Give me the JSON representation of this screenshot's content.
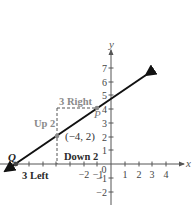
{
  "diagram": {
    "axes": {
      "x_label": "x",
      "y_label": "y",
      "x_ticks": [
        {
          "value": -7,
          "label": ""
        },
        {
          "value": -6,
          "label": ""
        },
        {
          "value": -5,
          "label": ""
        },
        {
          "value": -4,
          "label": ""
        },
        {
          "value": -3,
          "label": ""
        },
        {
          "value": -2,
          "label": "−2"
        },
        {
          "value": -1,
          "label": "−1"
        },
        {
          "value": 1,
          "label": "1"
        },
        {
          "value": 2,
          "label": "2"
        },
        {
          "value": 3,
          "label": "3"
        },
        {
          "value": 4,
          "label": "4"
        }
      ],
      "y_ticks": [
        {
          "value": 7,
          "label": "7"
        },
        {
          "value": 6,
          "label": "6"
        },
        {
          "value": 5,
          "label": "5"
        },
        {
          "value": 4,
          "label": "4"
        },
        {
          "value": 3,
          "label": "3"
        },
        {
          "value": 2,
          "label": "2"
        },
        {
          "value": 1,
          "label": "1"
        },
        {
          "value": -1,
          "label": "−1"
        },
        {
          "value": -2,
          "label": "−2"
        }
      ],
      "origin_label": "0"
    },
    "line": {
      "slope": "2/3",
      "through": [
        -4,
        2
      ],
      "color": "#111111"
    },
    "points": {
      "given": {
        "label": "(−4, 2)",
        "x": -4,
        "y": 2
      },
      "P": {
        "label": "P",
        "x": -1,
        "y": 4
      },
      "Q": {
        "label": "Q",
        "x": -7,
        "y": 0
      }
    },
    "annotations": {
      "right": "3 Right",
      "up": "Up 2",
      "down": "Down 2",
      "left": "3 Left"
    },
    "colors": {
      "gray_annotation": "#8a8a8a",
      "dark_annotation": "#2a2a2a",
      "axis": "#444444",
      "dashed": "#555555"
    }
  }
}
